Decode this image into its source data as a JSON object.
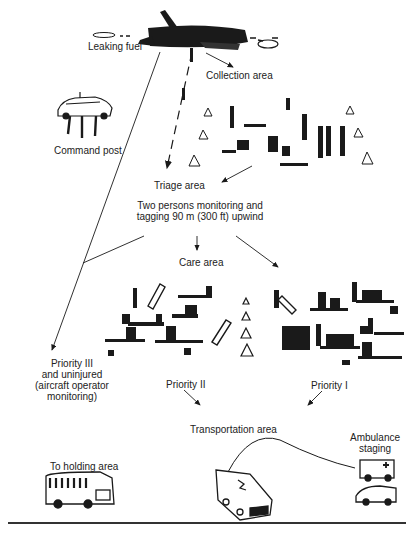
{
  "diagram": {
    "labels": {
      "leaking_fuel": "Leaking fuel",
      "collection_area": "Collection area",
      "command_post": "Command post",
      "triage_area": "Triage area",
      "triage_note_line1": "Two persons monitoring and",
      "triage_note_line2": "tagging 90 m (300 ft) upwind",
      "care_area": "Care area",
      "priority3_line1": "Priority III",
      "priority3_line2": "and uninjured",
      "priority3_line3": "(aircraft operator",
      "priority3_line4": "monitoring)",
      "priority2": "Priority II",
      "priority1": "Priority I",
      "transportation_area": "Transportation area",
      "ambulance_staging_line1": "Ambulance",
      "ambulance_staging_line2": "staging",
      "holding_area": "To holding area"
    },
    "illustrations": [
      "crashed-aircraft",
      "command-post-car-with-personnel",
      "collection-area-people-and-cones",
      "care-area-stretchers-left",
      "care-area-cones-divider",
      "care-area-stretchers-right",
      "bus",
      "ambulance-transport",
      "ambulances-staging"
    ],
    "colors": {
      "ink": "#1a1a1a",
      "background": "#ffffff"
    }
  }
}
